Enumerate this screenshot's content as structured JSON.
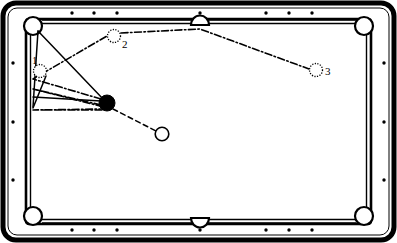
{
  "diagram": {
    "type": "billiards-table-shot-diagram",
    "colors": {
      "rail_outer": "#000000",
      "cloth": "#ffffff",
      "cushion_line": "#000000",
      "cue_ball_fill": "#000000",
      "object_ball_fill": "#ffffff",
      "line": "#000000"
    },
    "table": {
      "outer_rect": {
        "x": 3,
        "y": 3,
        "width": 391,
        "height": 237,
        "radius": 12
      },
      "cushion_rect": {
        "x": 27,
        "y": 20,
        "width": 343,
        "height": 203
      },
      "playfield_rect": {
        "x": 31,
        "y": 24,
        "width": 335,
        "height": 195
      }
    },
    "pockets": [
      {
        "name": "top-left-pocket",
        "cx": 33,
        "cy": 26
      },
      {
        "name": "top-center-pocket",
        "cx": 200,
        "cy": 21
      },
      {
        "name": "top-right-pocket",
        "cx": 364,
        "cy": 26
      },
      {
        "name": "bottom-left-pocket",
        "cx": 33,
        "cy": 215
      },
      {
        "name": "bottom-center-pocket",
        "cx": 200,
        "cy": 221
      },
      {
        "name": "bottom-right-pocket",
        "cx": 364,
        "cy": 215
      }
    ],
    "diamonds": {
      "top": [
        72,
        94,
        117,
        200,
        266,
        289,
        312
      ],
      "bottom": [
        72,
        94,
        117,
        200,
        266,
        289,
        312
      ],
      "left": [
        63,
        122,
        180
      ],
      "right": [
        63,
        122,
        180
      ],
      "top_y": 13,
      "bottom_y": 230,
      "left_x": 13,
      "right_x": 384
    },
    "balls": [
      {
        "name": "cue-ball",
        "label": "",
        "cx": 107,
        "cy": 103,
        "r": 8,
        "style": "solid-black"
      },
      {
        "name": "object-ball-1",
        "label": "1",
        "label_x": 34,
        "label_y": 63,
        "cx": 40,
        "cy": 71,
        "r": 7,
        "style": "dotted-outline"
      },
      {
        "name": "object-ball-2",
        "label": "2",
        "label_x": 124,
        "label_y": 47,
        "cx": 114,
        "cy": 36,
        "r": 7,
        "style": "dotted-outline"
      },
      {
        "name": "object-ball-3",
        "label": "3",
        "label_x": 327,
        "label_y": 74,
        "cx": 316,
        "cy": 70,
        "r": 7,
        "style": "dotted-outline"
      },
      {
        "name": "target-ball",
        "label": "",
        "cx": 162,
        "cy": 134,
        "r": 7,
        "style": "solid-outline"
      }
    ],
    "shot_lines": [
      {
        "name": "aim-line-pocket-to-cueball",
        "style": "solid",
        "points": [
          [
            38,
            31
          ],
          [
            107,
            103
          ]
        ]
      },
      {
        "name": "aim-line-pocket-to-left-rail",
        "style": "solid",
        "points": [
          [
            38,
            31
          ],
          [
            33,
            108
          ]
        ]
      },
      {
        "name": "aim-line-ball1-to-lower-rail",
        "style": "solid",
        "points": [
          [
            45,
            76
          ],
          [
            33,
            108
          ]
        ]
      },
      {
        "name": "bank-path-cueball-to-ball2",
        "style": "dash-dot",
        "points": [
          [
            107,
            103
          ],
          [
            33,
            79
          ],
          [
            114,
            36
          ]
        ]
      },
      {
        "name": "bank-path-ball2-to-ball3",
        "style": "dash-dot",
        "points": [
          [
            121,
            33
          ],
          [
            200,
            28
          ],
          [
            316,
            70
          ]
        ]
      },
      {
        "name": "bank-path-cueball-left-rail-low",
        "style": "dash-dot",
        "points": [
          [
            102,
            110
          ],
          [
            33,
            96
          ],
          [
            107,
            103
          ]
        ]
      },
      {
        "name": "bank-path-cueball-left-rail-lowest",
        "style": "dash-dot",
        "points": [
          [
            104,
            112
          ],
          [
            33,
            109
          ],
          [
            110,
            106
          ]
        ]
      },
      {
        "name": "cut-line-cueball-to-target",
        "style": "dashed",
        "points": [
          [
            112,
            109
          ],
          [
            162,
            134
          ]
        ]
      }
    ]
  }
}
